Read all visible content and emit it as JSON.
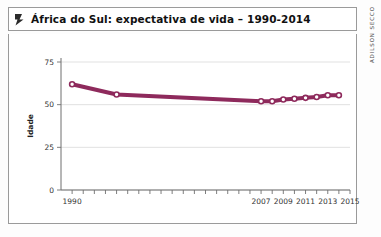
{
  "title": {
    "text": "África do Sul: expectativa de vida – 1990-2014",
    "icon": "flag-marker-icon"
  },
  "credit": {
    "text": "ADILSON SECCO"
  },
  "colors": {
    "series": "#8E2A5C",
    "grid": "#d9d9d9",
    "axis": "#6f6f6f",
    "frame": "#9a9a9a",
    "title_text": "#111111"
  },
  "chart_data": {
    "type": "line",
    "title": "África do Sul: expectativa de vida – 1990-2014",
    "xlabel": "",
    "ylabel": "Idade",
    "x": [
      1990,
      1993,
      1996,
      1999,
      2002,
      2005,
      2008,
      2011,
      2014,
      2017
    ],
    "xtick_labels": [
      "1990",
      "2007",
      "2009",
      "2011",
      "2013",
      "2015"
    ],
    "xtick_values": [
      1990,
      2007,
      2009,
      2011,
      2013,
      2015
    ],
    "xlim": [
      1989,
      2015
    ],
    "ylim": [
      0,
      75
    ],
    "ytick_labels": [
      "0",
      "25",
      "50",
      "75"
    ],
    "ytick_values": [
      0,
      25,
      50,
      75
    ],
    "grid": true,
    "legend": "none",
    "series": [
      {
        "name": "Expectativa de vida",
        "color": "#8E2A5C",
        "marker": "circle-open",
        "points": [
          {
            "year": 1990,
            "value": 62
          },
          {
            "year": 1994,
            "value": 56
          },
          {
            "year": 2007,
            "value": 52
          },
          {
            "year": 2008,
            "value": 52
          },
          {
            "year": 2009,
            "value": 53
          },
          {
            "year": 2010,
            "value": 53.5
          },
          {
            "year": 2011,
            "value": 54
          },
          {
            "year": 2012,
            "value": 54.5
          },
          {
            "year": 2013,
            "value": 55.5
          },
          {
            "year": 2014,
            "value": 55.5
          }
        ]
      }
    ]
  }
}
